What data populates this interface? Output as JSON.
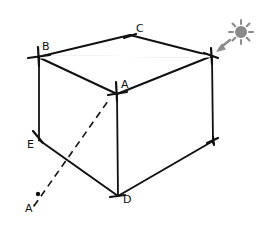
{
  "diagram": {
    "title": "",
    "colors": {
      "stroke": "#111111",
      "sun": "#8a8a8a",
      "background": "#ffffff"
    },
    "labels": {
      "B": "B",
      "C": "C",
      "A": "A",
      "E": "E",
      "D": "D",
      "A_prime": "A'"
    },
    "icons": {
      "sun": "sun-icon",
      "light_direction": "arrow-icon"
    }
  }
}
